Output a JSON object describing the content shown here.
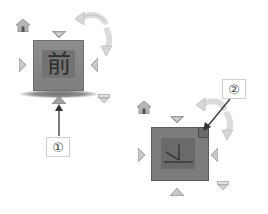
{
  "diagram": {
    "views": [
      {
        "id": "view-1",
        "cube_face_label": "前",
        "cube_face_meaning": "Front",
        "callout_number": "①",
        "callout_target": "bottom-arrow"
      },
      {
        "id": "view-2",
        "cube_face_label": "",
        "cube_face_meaning": "Corner / axis view",
        "callout_number": "②",
        "callout_target": "top-right-corner"
      }
    ],
    "controls": {
      "home_icon": "home-icon",
      "rotate_icon": "curved-rotate-arrow-icon",
      "arrows": [
        "arrow-up-icon",
        "arrow-down-icon",
        "arrow-left-icon",
        "arrow-right-icon"
      ],
      "menu_icon": "dropdown-menu-icon"
    },
    "colors": {
      "cube_fill": "#858585",
      "cube_face": "#737373",
      "arrow_fill": "#9a9a9a",
      "rotate_arrow": "#d9d9d9",
      "callout_border": "#cfcfcf",
      "pointer_line": "#333333"
    }
  }
}
